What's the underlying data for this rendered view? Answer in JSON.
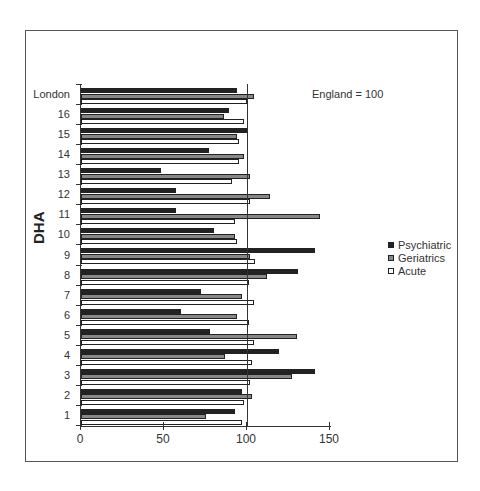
{
  "chart_data": {
    "type": "bar",
    "orientation": "horizontal",
    "title": "",
    "xlabel": "",
    "ylabel": "DHA",
    "annotation": "England = 100",
    "xlim": [
      0,
      150
    ],
    "xticks": [
      "0",
      "50",
      "100",
      "150"
    ],
    "reference_line": 100,
    "grid": false,
    "legend_position": "right",
    "categories": [
      "London",
      "16",
      "15",
      "14",
      "13",
      "12",
      "11",
      "10",
      "9",
      "8",
      "7",
      "6",
      "5",
      "4",
      "3",
      "2",
      "1"
    ],
    "series": [
      {
        "name": "Psychiatric",
        "color": "#222222",
        "values": [
          94,
          89,
          100,
          77,
          48,
          57,
          57,
          80,
          141,
          131,
          72,
          60,
          78,
          119,
          141,
          97,
          93
        ]
      },
      {
        "name": "Geriatrics",
        "color": "#888888",
        "values": [
          104,
          86,
          94,
          98,
          102,
          114,
          144,
          93,
          102,
          112,
          97,
          94,
          130,
          87,
          127,
          103,
          75
        ]
      },
      {
        "name": "Acute",
        "color": "#ffffff",
        "values": [
          100,
          98,
          95,
          95,
          91,
          102,
          93,
          94,
          105,
          101,
          104,
          101,
          104,
          103,
          102,
          98,
          97
        ]
      }
    ]
  },
  "labels": {
    "axis_title": "DHA",
    "note": "England = 100",
    "legend": [
      "Psychiatric",
      "Geriatrics",
      "Acute"
    ],
    "xticks": [
      "0",
      "50",
      "100",
      "150"
    ],
    "categories": [
      "London",
      "16",
      "15",
      "14",
      "13",
      "12",
      "11",
      "10",
      "9",
      "8",
      "7",
      "6",
      "5",
      "4",
      "3",
      "2",
      "1"
    ]
  }
}
